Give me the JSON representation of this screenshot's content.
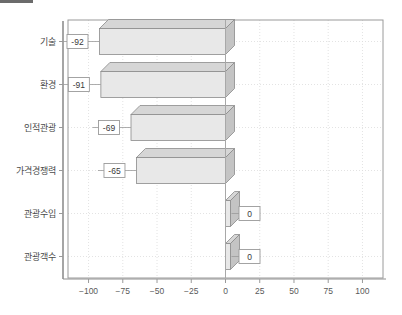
{
  "chart_data": {
    "type": "bar",
    "orientation": "horizontal",
    "style": "3d",
    "title": "",
    "subtitle": "",
    "xlabel": "",
    "ylabel": "",
    "categories": [
      "기술",
      "환경",
      "인적관광",
      "가격경쟁력",
      "관광수입",
      "관광객수"
    ],
    "values": [
      -92,
      -91,
      -69,
      -65,
      0,
      0
    ],
    "value_labels": [
      "-92",
      "-91",
      "-69",
      "-65",
      "0",
      "0"
    ],
    "xlim": [
      -115,
      115
    ],
    "xticks": [
      -100,
      -75,
      -50,
      -25,
      0,
      25,
      50,
      75,
      100
    ],
    "xtick_labels": [
      "−100",
      "−75",
      "−50",
      "−25",
      "0",
      "25",
      "50",
      "75",
      "100"
    ],
    "grid": true,
    "grid_style": "dotted",
    "legend": "none",
    "zero_line": 0,
    "series": [
      {
        "name": "",
        "values": [
          -92,
          -91,
          -69,
          -65,
          0,
          0
        ]
      }
    ],
    "colors": {
      "bar_front": "#e8e8e8",
      "bar_top": "#d6d6d6",
      "bar_side": "#c4c4c4",
      "bar_edge": "#8a8a8a",
      "grid": "#dcdcdc",
      "axis": "#9a9a9a",
      "zero_line": "#a8a8a8",
      "label_box_fill": "#ffffff",
      "label_box_border": "#9a9a9a",
      "text": "#4a4a4a",
      "background": "#ffffff",
      "corner_strip": "#6b6b6b"
    }
  }
}
